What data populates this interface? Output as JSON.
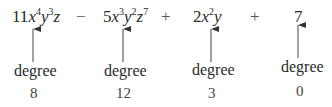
{
  "expression": {
    "terms": [
      {
        "coef": "11",
        "vars": [
          {
            "v": "x",
            "e": "4"
          },
          {
            "v": "y",
            "e": "3"
          },
          {
            "v": "z",
            "e": ""
          }
        ],
        "label": "degree",
        "degree": "8"
      },
      {
        "coef": "5",
        "vars": [
          {
            "v": "x",
            "e": "3"
          },
          {
            "v": "y",
            "e": "2"
          },
          {
            "v": "z",
            "e": "7"
          }
        ],
        "label": "degree",
        "degree": "12"
      },
      {
        "coef": "2",
        "vars": [
          {
            "v": "x",
            "e": "2"
          },
          {
            "v": "y",
            "e": ""
          }
        ],
        "label": "degree",
        "degree": "3"
      },
      {
        "coef": "7",
        "vars": [],
        "label": "degree",
        "degree": "0"
      }
    ],
    "operators": [
      "−",
      "+",
      "+"
    ]
  },
  "colors": {
    "text": "#2a2a2a",
    "arrow": "#333333"
  }
}
